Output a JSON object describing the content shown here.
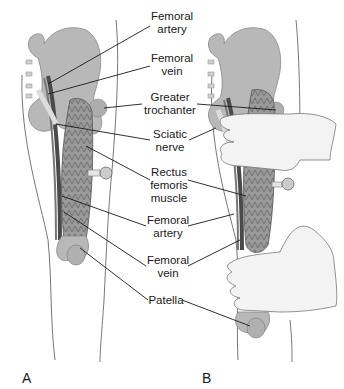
{
  "figure": {
    "panels": [
      {
        "id": "A",
        "label": "A"
      },
      {
        "id": "B",
        "label": "B"
      }
    ],
    "labels": [
      {
        "line1": "Femoral",
        "line2": "artery"
      },
      {
        "line1": "Femoral",
        "line2": "vein"
      },
      {
        "line1": "Greater",
        "line2": "trochanter"
      },
      {
        "line1": "Sciatic",
        "line2": "nerve"
      },
      {
        "line1": "Rectus",
        "line2": "femoris",
        "line3": "muscle"
      },
      {
        "line1": "Femoral",
        "line2": "artery"
      },
      {
        "line1": "Femoral",
        "line2": "vein"
      },
      {
        "line1": "Patella"
      }
    ],
    "colors": {
      "bone": "#b5b5b5",
      "muscle": "#8f8f8f",
      "vessel_dark": "#555555",
      "skin_outline": "#666666",
      "hand_fill": "#f2f2f2",
      "leader_line": "#1a1a1a"
    }
  }
}
